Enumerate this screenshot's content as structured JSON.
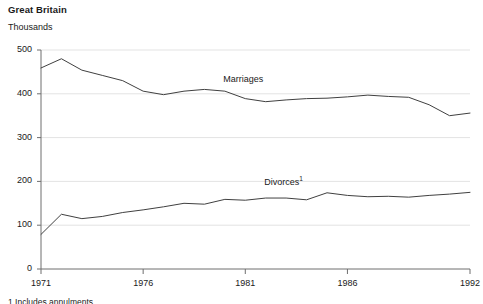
{
  "chart_data": {
    "type": "line",
    "title": "Great Britain",
    "subtitle": "",
    "ylabel": "Thousands",
    "xlabel": "",
    "ylim": [
      0,
      500
    ],
    "xlim": [
      1971,
      1992
    ],
    "yticks": [
      0,
      100,
      200,
      300,
      400,
      500
    ],
    "ytick_labels": [
      "0",
      "100",
      "200",
      "300",
      "400",
      "500"
    ],
    "xticks": [
      1971,
      1976,
      1981,
      1986,
      1992
    ],
    "xtick_labels": [
      "1971",
      "1976",
      "1981",
      "1986",
      "1992"
    ],
    "grid": true,
    "grid_axis": "y",
    "legend": "inline-labels",
    "line_color": "#404040",
    "grid_color": "#e3e3e3",
    "axis_color": "#6e6e6e",
    "x": [
      1971,
      1972,
      1973,
      1974,
      1975,
      1976,
      1977,
      1978,
      1979,
      1980,
      1981,
      1982,
      1983,
      1984,
      1985,
      1986,
      1987,
      1988,
      1989,
      1990,
      1991,
      1992
    ],
    "series": [
      {
        "name": "Marriages",
        "label": "Marriages",
        "label_x": 1981,
        "label_y": 432,
        "values": [
          459,
          480,
          454,
          442,
          430,
          406,
          398,
          406,
          410,
          406,
          389,
          382,
          386,
          389,
          390,
          393,
          397,
          394,
          392,
          375,
          350,
          356
        ]
      },
      {
        "name": "Divorces",
        "label": "Divorces",
        "label_superscript": "1",
        "label_x": 1983,
        "label_y": 196,
        "values": [
          79,
          125,
          115,
          120,
          129,
          135,
          142,
          150,
          148,
          159,
          157,
          162,
          162,
          158,
          174,
          168,
          165,
          166,
          164,
          168,
          171,
          175
        ]
      }
    ],
    "footnote": "1 Includes annulments."
  }
}
